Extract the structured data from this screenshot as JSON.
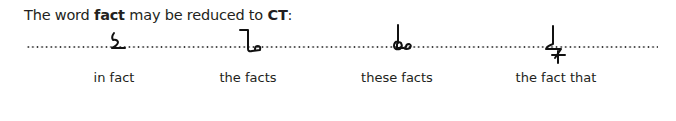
{
  "heading": {
    "prefix": "The word ",
    "keyword": "fact",
    "middle": " may be reduced to ",
    "abbrev": "CT",
    "suffix": ":"
  },
  "line": {
    "style": "dotted",
    "color": "#3a3a3a"
  },
  "examples": [
    {
      "label": "in fact",
      "outline_icon": "shorthand-in-fact-outline"
    },
    {
      "label": "the facts",
      "outline_icon": "shorthand-the-facts-outline"
    },
    {
      "label": "these facts",
      "outline_icon": "shorthand-these-facts-outline"
    },
    {
      "label": "the fact that",
      "outline_icon": "shorthand-the-fact-that-outline"
    }
  ],
  "colors": {
    "text": "#231f20",
    "ink": "#111111",
    "background": "#ffffff"
  }
}
